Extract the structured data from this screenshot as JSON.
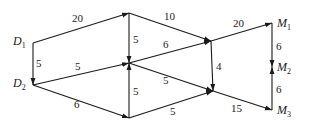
{
  "diagram": {
    "type": "directed-weighted-network",
    "colors": {
      "stroke": "#1a1a1a",
      "background": "#ffffff"
    },
    "nodes": [
      {
        "id": "D1",
        "label": "D",
        "sub": "1",
        "x": 33,
        "y": 43
      },
      {
        "id": "D2",
        "label": "D",
        "sub": "2",
        "x": 33,
        "y": 85
      },
      {
        "id": "A",
        "label": "",
        "sub": "",
        "x": 129,
        "y": 13
      },
      {
        "id": "B",
        "label": "",
        "sub": "",
        "x": 129,
        "y": 63
      },
      {
        "id": "C",
        "label": "",
        "sub": "",
        "x": 129,
        "y": 118
      },
      {
        "id": "E",
        "label": "",
        "sub": "",
        "x": 211,
        "y": 41
      },
      {
        "id": "F",
        "label": "",
        "sub": "",
        "x": 213,
        "y": 91
      },
      {
        "id": "M1",
        "label": "M",
        "sub": "1",
        "x": 272,
        "y": 23
      },
      {
        "id": "M2",
        "label": "M",
        "sub": "2",
        "x": 272,
        "y": 67
      },
      {
        "id": "M3",
        "label": "M",
        "sub": "3",
        "x": 272,
        "y": 110
      }
    ],
    "edges": [
      {
        "from": "D1",
        "to": "A",
        "weight": "20",
        "lx": 72,
        "ly": 22
      },
      {
        "from": "D1",
        "to": "D2",
        "weight": "5",
        "lx": 36,
        "ly": 67
      },
      {
        "from": "A",
        "to": "B",
        "weight": "5",
        "lx": 133,
        "ly": 43
      },
      {
        "from": "D2",
        "to": "B",
        "weight": "5",
        "lx": 75,
        "ly": 70
      },
      {
        "from": "D2",
        "to": "C",
        "weight": "6",
        "lx": 74,
        "ly": 108
      },
      {
        "from": "C",
        "to": "B",
        "weight": "5",
        "lx": 133,
        "ly": 95
      },
      {
        "from": "A",
        "to": "E",
        "weight": "10",
        "lx": 164,
        "ly": 20
      },
      {
        "from": "B",
        "to": "E",
        "weight": "6",
        "lx": 163,
        "ly": 48
      },
      {
        "from": "E",
        "to": "F",
        "weight": "4",
        "lx": 216,
        "ly": 70
      },
      {
        "from": "B",
        "to": "F",
        "weight": "5",
        "lx": 163,
        "ly": 84
      },
      {
        "from": "C",
        "to": "F",
        "weight": "5",
        "lx": 170,
        "ly": 115
      },
      {
        "from": "E",
        "to": "M1",
        "weight": "20",
        "lx": 233,
        "ly": 27
      },
      {
        "from": "F",
        "to": "M3",
        "weight": "15",
        "lx": 231,
        "ly": 112
      },
      {
        "from": "M1",
        "to": "M2",
        "weight": "6",
        "lx": 276,
        "ly": 50
      },
      {
        "from": "M3",
        "to": "M2",
        "weight": "6",
        "lx": 276,
        "ly": 93
      }
    ]
  }
}
